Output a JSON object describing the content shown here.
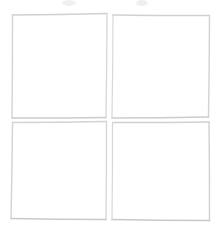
{
  "image": {
    "title": "Hand-drawn 2x2 grid of four squares",
    "description": "Four faint pencil-drawn squares arranged in a two-by-two grid on plain white paper",
    "width": 221,
    "height": 230,
    "background_color": "#ffffff",
    "medium": "pencil-on-paper-scan"
  },
  "palette": {
    "stroke_light": "#dcdcde",
    "stroke_mid": "#d0d0d3",
    "stroke_dark": "#c2c2c6",
    "smudge": "#e6e6e8",
    "paper": "#ffffff"
  },
  "figure": {
    "shape_count": 4,
    "arrangement": "2x2 grid",
    "grid_rows": 2,
    "grid_columns": 2,
    "shapes": [
      {
        "name": "top-left-square",
        "row": 1,
        "column": 1,
        "label": "Top left square",
        "corners": [
          [
            12.5,
            15.0
          ],
          [
            107.0,
            13.5
          ],
          [
            106.0,
            117.5
          ],
          [
            12.0,
            118.0
          ]
        ],
        "stroke_color": "#d0d0d3",
        "stroke_width": 1.4
      },
      {
        "name": "top-right-square",
        "row": 1,
        "column": 2,
        "label": "Top right square",
        "corners": [
          [
            113.0,
            15.0
          ],
          [
            209.5,
            15.5
          ],
          [
            208.5,
            117.0
          ],
          [
            112.0,
            118.0
          ]
        ],
        "stroke_color": "#cfcfd2",
        "stroke_width": 1.4
      },
      {
        "name": "bottom-left-square",
        "row": 2,
        "column": 1,
        "label": "Bottom left square",
        "corners": [
          [
            12.5,
            122.5
          ],
          [
            106.5,
            121.5
          ],
          [
            106.0,
            219.5
          ],
          [
            11.0,
            218.5
          ]
        ],
        "stroke_color": "#cbcbcf",
        "stroke_width": 1.5
      },
      {
        "name": "bottom-right-square",
        "row": 2,
        "column": 2,
        "label": "Bottom right square",
        "corners": [
          [
            112.5,
            122.5
          ],
          [
            209.0,
            122.0
          ],
          [
            209.5,
            220.5
          ],
          [
            112.0,
            219.5
          ]
        ],
        "stroke_color": "#cbcbcf",
        "stroke_width": 1.5
      }
    ],
    "smudges": [
      {
        "name": "top-smudge-left",
        "x": 62,
        "y": 0,
        "width": 14,
        "height": 6
      },
      {
        "name": "top-smudge-right",
        "x": 136,
        "y": 0,
        "width": 12,
        "height": 6
      }
    ]
  }
}
